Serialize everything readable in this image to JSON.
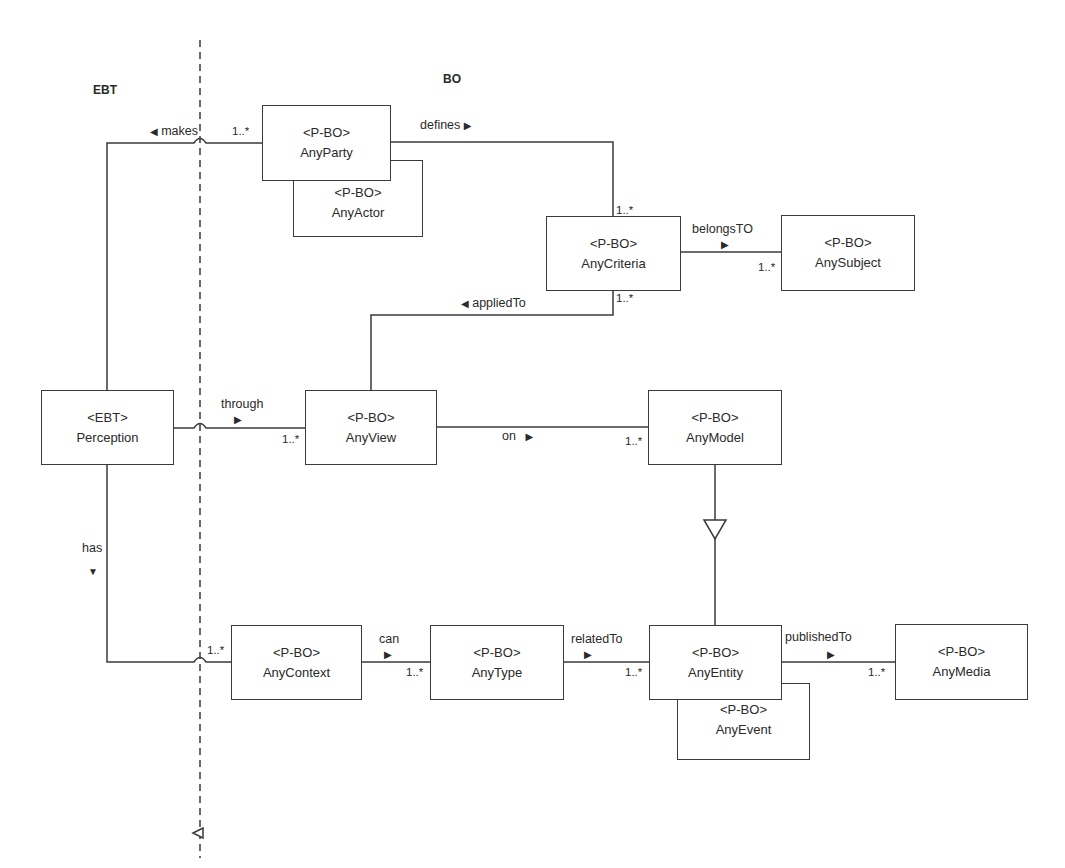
{
  "zones": {
    "left": "EBT",
    "right": "BO"
  },
  "classes": {
    "anyParty": {
      "stereotype": "<P-BO>",
      "name": "AnyParty"
    },
    "anyActor": {
      "stereotype": "<P-BO>",
      "name": "AnyActor"
    },
    "anyCriteria": {
      "stereotype": "<P-BO>",
      "name": "AnyCriteria"
    },
    "anySubject": {
      "stereotype": "<P-BO>",
      "name": "AnySubject"
    },
    "perception": {
      "stereotype": "<EBT>",
      "name": "Perception"
    },
    "anyView": {
      "stereotype": "<P-BO>",
      "name": "AnyView"
    },
    "anyModel": {
      "stereotype": "<P-BO>",
      "name": "AnyModel"
    },
    "anyContext": {
      "stereotype": "<P-BO>",
      "name": "AnyContext"
    },
    "anyType": {
      "stereotype": "<P-BO>",
      "name": "AnyType"
    },
    "anyEntity": {
      "stereotype": "<P-BO>",
      "name": "AnyEntity"
    },
    "anyEvent": {
      "stereotype": "<P-BO>",
      "name": "AnyEvent"
    },
    "anyMedia": {
      "stereotype": "<P-BO>",
      "name": "AnyMedia"
    }
  },
  "associations": {
    "makes": {
      "label": "makes",
      "direction": "◀",
      "multiplicity": "1..*"
    },
    "defines": {
      "label": "defines",
      "direction": "▶",
      "multiplicity": "1..*"
    },
    "belongsTO": {
      "label": "belongsTO",
      "direction": "▶",
      "multiplicity": "1..*"
    },
    "appliedTo": {
      "label": "appliedTo",
      "direction": "◀",
      "multiplicity": "1..*"
    },
    "through": {
      "label": "through",
      "direction": "▶",
      "multiplicity": "1..*"
    },
    "on": {
      "label": "on",
      "direction": "▶",
      "multiplicity": "1..*"
    },
    "has": {
      "label": "has",
      "direction": "▼",
      "multiplicity": "1..*"
    },
    "can": {
      "label": "can",
      "direction": "▶",
      "multiplicity": "1..*"
    },
    "relatedTo": {
      "label": "relatedTo",
      "direction": "▶",
      "multiplicity": "1..*"
    },
    "publishedTo": {
      "label": "publishedTo",
      "direction": "▶",
      "multiplicity": "1..*"
    }
  },
  "generalization": {
    "from": "AnyEntity",
    "to": "AnyModel"
  },
  "colors": {
    "line": "#3a3a3a",
    "text": "#2a2a2a",
    "background": "#ffffff"
  }
}
